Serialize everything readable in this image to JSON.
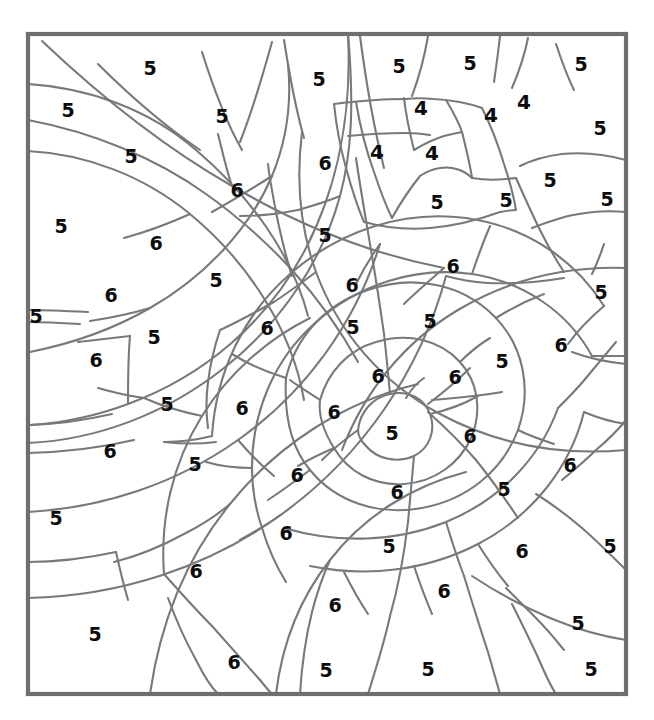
{
  "page": {
    "kind": "color-by-number-worksheet",
    "background_color": "#ffffff",
    "line_color": "#77797b",
    "frame_color": "#6d6f71",
    "number_color": "#0c0c0c",
    "frame": {
      "x": 28,
      "y": 34,
      "width": 598,
      "height": 660
    },
    "legend_values": [
      "4",
      "5",
      "6"
    ]
  },
  "numbers": [
    {
      "id": "n-001",
      "value": "5",
      "x": 150,
      "y": 68
    },
    {
      "id": "n-002",
      "value": "5",
      "x": 319,
      "y": 79
    },
    {
      "id": "n-003",
      "value": "5",
      "x": 399,
      "y": 66
    },
    {
      "id": "n-004",
      "value": "5",
      "x": 470,
      "y": 63
    },
    {
      "id": "n-005",
      "value": "5",
      "x": 581,
      "y": 64
    },
    {
      "id": "n-006",
      "value": "5",
      "x": 68,
      "y": 110
    },
    {
      "id": "n-007",
      "value": "5",
      "x": 222,
      "y": 116
    },
    {
      "id": "n-008",
      "value": "4",
      "x": 421,
      "y": 108
    },
    {
      "id": "n-009",
      "value": "4",
      "x": 491,
      "y": 115
    },
    {
      "id": "n-010",
      "value": "4",
      "x": 524,
      "y": 102
    },
    {
      "id": "n-011",
      "value": "5",
      "x": 600,
      "y": 128
    },
    {
      "id": "n-012",
      "value": "5",
      "x": 131,
      "y": 156
    },
    {
      "id": "n-013",
      "value": "6",
      "x": 325,
      "y": 163
    },
    {
      "id": "n-014",
      "value": "4",
      "x": 377,
      "y": 152
    },
    {
      "id": "n-015",
      "value": "4",
      "x": 432,
      "y": 153
    },
    {
      "id": "n-016",
      "value": "6",
      "x": 237,
      "y": 190
    },
    {
      "id": "n-017",
      "value": "5",
      "x": 437,
      "y": 202
    },
    {
      "id": "n-018",
      "value": "5",
      "x": 506,
      "y": 200
    },
    {
      "id": "n-019",
      "value": "5",
      "x": 550,
      "y": 180
    },
    {
      "id": "n-020",
      "value": "5",
      "x": 607,
      "y": 199
    },
    {
      "id": "n-021",
      "value": "5",
      "x": 61,
      "y": 226
    },
    {
      "id": "n-022",
      "value": "5",
      "x": 325,
      "y": 235
    },
    {
      "id": "n-023",
      "value": "6",
      "x": 156,
      "y": 243
    },
    {
      "id": "n-024",
      "value": "5",
      "x": 216,
      "y": 280
    },
    {
      "id": "n-025",
      "value": "6",
      "x": 453,
      "y": 266
    },
    {
      "id": "n-026",
      "value": "5",
      "x": 601,
      "y": 292
    },
    {
      "id": "n-027",
      "value": "6",
      "x": 111,
      "y": 295
    },
    {
      "id": "n-028",
      "value": "5",
      "x": 36,
      "y": 316
    },
    {
      "id": "n-029",
      "value": "6",
      "x": 267,
      "y": 328
    },
    {
      "id": "n-030",
      "value": "6",
      "x": 352,
      "y": 285
    },
    {
      "id": "n-031",
      "value": "5",
      "x": 353,
      "y": 327
    },
    {
      "id": "n-032",
      "value": "5",
      "x": 430,
      "y": 321
    },
    {
      "id": "n-033",
      "value": "6",
      "x": 561,
      "y": 345
    },
    {
      "id": "n-034",
      "value": "5",
      "x": 154,
      "y": 337
    },
    {
      "id": "n-035",
      "value": "6",
      "x": 96,
      "y": 360
    },
    {
      "id": "n-036",
      "value": "6",
      "x": 378,
      "y": 376
    },
    {
      "id": "n-037",
      "value": "6",
      "x": 455,
      "y": 377
    },
    {
      "id": "n-038",
      "value": "5",
      "x": 502,
      "y": 361
    },
    {
      "id": "n-039",
      "value": "6",
      "x": 242,
      "y": 408
    },
    {
      "id": "n-040",
      "value": "6",
      "x": 334,
      "y": 412
    },
    {
      "id": "n-041",
      "value": "5",
      "x": 167,
      "y": 404
    },
    {
      "id": "n-042",
      "value": "5",
      "x": 392,
      "y": 433
    },
    {
      "id": "n-043",
      "value": "6",
      "x": 470,
      "y": 436
    },
    {
      "id": "n-044",
      "value": "6",
      "x": 110,
      "y": 451
    },
    {
      "id": "n-045",
      "value": "5",
      "x": 195,
      "y": 464
    },
    {
      "id": "n-046",
      "value": "6",
      "x": 297,
      "y": 475
    },
    {
      "id": "n-047",
      "value": "6",
      "x": 570,
      "y": 465
    },
    {
      "id": "n-048",
      "value": "6",
      "x": 397,
      "y": 492
    },
    {
      "id": "n-049",
      "value": "5",
      "x": 504,
      "y": 489
    },
    {
      "id": "n-050",
      "value": "5",
      "x": 56,
      "y": 518
    },
    {
      "id": "n-051",
      "value": "6",
      "x": 286,
      "y": 533
    },
    {
      "id": "n-052",
      "value": "5",
      "x": 389,
      "y": 546
    },
    {
      "id": "n-053",
      "value": "6",
      "x": 522,
      "y": 551
    },
    {
      "id": "n-054",
      "value": "5",
      "x": 610,
      "y": 546
    },
    {
      "id": "n-055",
      "value": "6",
      "x": 196,
      "y": 571
    },
    {
      "id": "n-056",
      "value": "6",
      "x": 444,
      "y": 591
    },
    {
      "id": "n-057",
      "value": "6",
      "x": 335,
      "y": 605
    },
    {
      "id": "n-058",
      "value": "5",
      "x": 578,
      "y": 623
    },
    {
      "id": "n-059",
      "value": "5",
      "x": 95,
      "y": 634
    },
    {
      "id": "n-060",
      "value": "6",
      "x": 234,
      "y": 662
    },
    {
      "id": "n-061",
      "value": "5",
      "x": 326,
      "y": 670
    },
    {
      "id": "n-062",
      "value": "5",
      "x": 428,
      "y": 669
    },
    {
      "id": "n-063",
      "value": "5",
      "x": 591,
      "y": 669
    }
  ]
}
